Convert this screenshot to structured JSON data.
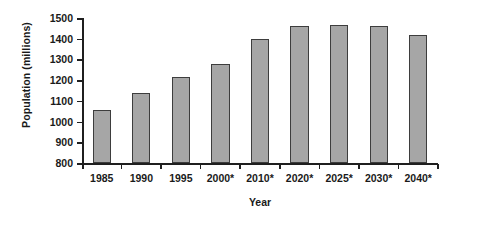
{
  "chart_data": {
    "type": "bar",
    "title": "",
    "xlabel": "Year",
    "ylabel": "Population (millions)",
    "categories": [
      "1985",
      "1990",
      "1995",
      "2000*",
      "2010*",
      "2020*",
      "2025*",
      "2030*",
      "2040*"
    ],
    "values": [
      1055,
      1140,
      1215,
      1280,
      1400,
      1460,
      1465,
      1460,
      1420
    ],
    "ylim": [
      800,
      1500
    ],
    "yticks": [
      800,
      900,
      1000,
      1100,
      1200,
      1300,
      1400,
      1500
    ],
    "ytick_labels": [
      "800",
      "900",
      "1000",
      "1100",
      "1200",
      "1300",
      "1400",
      "1500"
    ],
    "grid": false,
    "legend": false,
    "bar_color": "#a6a6a6",
    "bar_edge_color": "#3d3d3d",
    "axis_color": "#1f1f1f",
    "text_color": "#1a1a1a",
    "background": "#ffffff"
  }
}
